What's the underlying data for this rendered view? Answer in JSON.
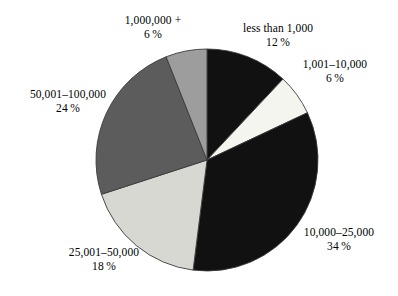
{
  "chart_data": {
    "type": "pie",
    "title": "",
    "subtitle": "",
    "xlabel": "",
    "ylabel": "",
    "legend_position": "none",
    "grid": false,
    "start_angle_deg": 0,
    "direction": "clockwise",
    "categories": [
      "less than 1,000",
      "1,001–10,000",
      "10,000–25,000",
      "25,001–50,000",
      "50,001–100,000",
      "1,000,000 +"
    ],
    "values": [
      12,
      6,
      34,
      18,
      24,
      6
    ],
    "value_unit": "%",
    "slices": [
      {
        "key": "lessthan1000",
        "label": "less than 1,000",
        "percent": 12,
        "percent_text": "12 %",
        "color": "#111111"
      },
      {
        "key": "1001-10000",
        "label": "1,001–10,000",
        "percent": 6,
        "percent_text": "6 %",
        "color": "#f5f5f0"
      },
      {
        "key": "10000-25000",
        "label": "10,000–25,000",
        "percent": 34,
        "percent_text": "34 %",
        "color": "#111111"
      },
      {
        "key": "25001-50000",
        "label": "25,001–50,000",
        "percent": 18,
        "percent_text": "18 %",
        "color": "#d8d8d2"
      },
      {
        "key": "50001-100000",
        "label": "50,001–100,000",
        "percent": 24,
        "percent_text": "24 %",
        "color": "#5c5c5c"
      },
      {
        "key": "1000000plus",
        "label": "1,000,000 +",
        "percent": 6,
        "percent_text": "6 %",
        "color": "#9d9d9d"
      }
    ],
    "geometry": {
      "center_x": 207,
      "center_y": 160,
      "radius": 111
    },
    "colors": {
      "background": "#ffffff",
      "outline": "#3a3a3a",
      "text": "#000000"
    }
  }
}
